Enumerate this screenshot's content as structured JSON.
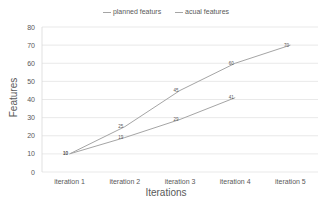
{
  "chart_data": {
    "type": "line",
    "title": "",
    "xlabel": "Iterations",
    "ylabel": "Features",
    "categories": [
      "iteration 1",
      "iteration 2",
      "iteration 3",
      "iteration 4",
      "iteration 5"
    ],
    "series": [
      {
        "name": "planned featurs",
        "values": [
          10,
          25,
          45,
          60,
          70
        ],
        "color": "#a5a5a5"
      },
      {
        "name": "acual features",
        "values": [
          10,
          19,
          29,
          41,
          null
        ],
        "color": "#a5a5a5"
      }
    ],
    "ylim": [
      0,
      80
    ],
    "yticks": [
      0,
      10,
      20,
      30,
      40,
      50,
      60,
      70,
      80
    ],
    "grid": true,
    "legend_position": "top",
    "data_labels": true
  },
  "legend": {
    "items": [
      "planned featurs",
      "acual features"
    ]
  },
  "axes": {
    "xlabel": "Iterations",
    "ylabel": "Features"
  }
}
